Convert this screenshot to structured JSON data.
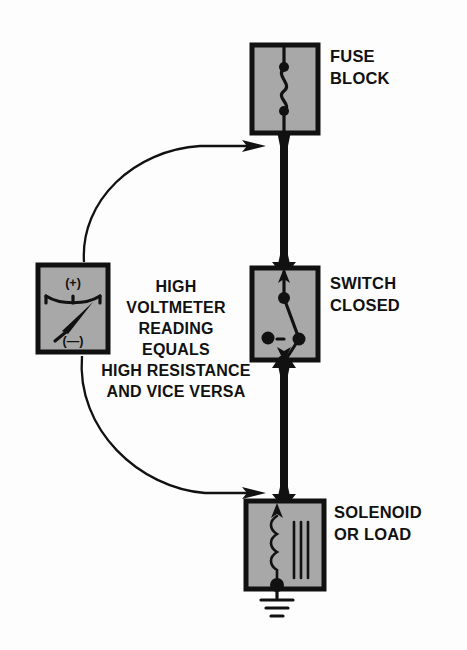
{
  "diagram": {
    "background_color": "#fdfdfd",
    "component_fill_color": "#a8a8a8",
    "line_color": "#111111"
  },
  "components": {
    "fuse_block": {
      "label_line1": "FUSE",
      "label_line2": "BLOCK",
      "symbol": "fuse-element"
    },
    "switch": {
      "label_line1": "SWITCH",
      "label_line2": "CLOSED",
      "symbol": "closed-switch"
    },
    "solenoid": {
      "label_line1": "SOLENOID",
      "label_line2": "OR LOAD",
      "symbol": "coil-with-core"
    },
    "voltmeter": {
      "positive_terminal": "(+)",
      "negative_terminal": "(—)",
      "symbol": "analog-meter-needle"
    }
  },
  "center_note": {
    "lines": [
      "HIGH",
      "VOLTMETER",
      "READING",
      "EQUALS",
      "HIGH RESISTANCE",
      "AND VICE VERSA"
    ]
  },
  "connections": {
    "ground_symbol": "earth-ground",
    "upper_probe_arrow": "arrow-to-fuse-output-wire",
    "lower_probe_arrow": "arrow-to-solenoid-input-wire"
  }
}
